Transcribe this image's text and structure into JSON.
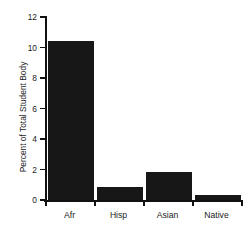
{
  "chart_data": {
    "type": "bar",
    "title": "",
    "xlabel": "",
    "ylabel": "Percent of Total Student Body",
    "categories": [
      "Afr",
      "Hisp",
      "Asian",
      "Native"
    ],
    "values": [
      10.45,
      0.85,
      1.85,
      0.3
    ],
    "ylim": [
      0,
      12
    ],
    "yticks": [
      0,
      2,
      4,
      6,
      8,
      10,
      12
    ],
    "ytick_labels": [
      "0",
      "2",
      "4",
      "6",
      "8",
      "10",
      "12"
    ],
    "grid": false,
    "legend": null,
    "bar_color": "#171717",
    "axis_color": "#111111",
    "text_color": "#1a1a1a",
    "background": "#ffffff"
  },
  "axes": {
    "y_title": "Percent of Total Student Body"
  },
  "title": {
    "text": ""
  }
}
